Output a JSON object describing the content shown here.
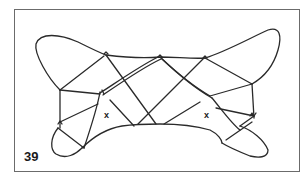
{
  "figure": {
    "number": "39",
    "markers": [
      {
        "label": "x",
        "side": "left"
      },
      {
        "label": "x",
        "side": "right"
      }
    ],
    "stroke_color": "#2a2a2a",
    "frame_color": "#6b6b6b",
    "background_color": "#ffffff"
  }
}
